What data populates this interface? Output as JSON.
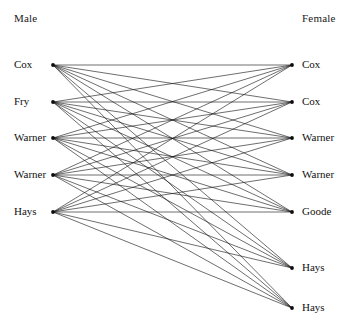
{
  "header": {
    "left_title": "Male",
    "right_title": "Female"
  },
  "chart_data": {
    "type": "diagram",
    "diagram_kind": "bipartite-graph",
    "title": "",
    "left_group_label": "Male",
    "right_group_label": "Female",
    "left_nodes": [
      {
        "id": "L0",
        "label": "Cox",
        "x": 53,
        "y": 65
      },
      {
        "id": "L1",
        "label": "Fry",
        "x": 53,
        "y": 102
      },
      {
        "id": "L2",
        "label": "Warner",
        "x": 53,
        "y": 138
      },
      {
        "id": "L3",
        "label": "Warner",
        "x": 53,
        "y": 175
      },
      {
        "id": "L4",
        "label": "Hays",
        "x": 53,
        "y": 212
      }
    ],
    "right_nodes": [
      {
        "id": "R0",
        "label": "Cox",
        "x": 292,
        "y": 65
      },
      {
        "id": "R1",
        "label": "Cox",
        "x": 292,
        "y": 102
      },
      {
        "id": "R2",
        "label": "Warner",
        "x": 292,
        "y": 138
      },
      {
        "id": "R3",
        "label": "Warner",
        "x": 292,
        "y": 175
      },
      {
        "id": "R4",
        "label": "Goode",
        "x": 292,
        "y": 212
      },
      {
        "id": "R5",
        "label": "Hays",
        "x": 292,
        "y": 268
      },
      {
        "id": "R6",
        "label": "Hays",
        "x": 292,
        "y": 308
      }
    ],
    "edges": [
      [
        "L0",
        "R0"
      ],
      [
        "L0",
        "R1"
      ],
      [
        "L0",
        "R2"
      ],
      [
        "L0",
        "R3"
      ],
      [
        "L0",
        "R4"
      ],
      [
        "L0",
        "R5"
      ],
      [
        "L0",
        "R6"
      ],
      [
        "L1",
        "R0"
      ],
      [
        "L1",
        "R1"
      ],
      [
        "L1",
        "R2"
      ],
      [
        "L1",
        "R3"
      ],
      [
        "L1",
        "R4"
      ],
      [
        "L1",
        "R5"
      ],
      [
        "L1",
        "R6"
      ],
      [
        "L2",
        "R0"
      ],
      [
        "L2",
        "R1"
      ],
      [
        "L2",
        "R2"
      ],
      [
        "L2",
        "R3"
      ],
      [
        "L2",
        "R4"
      ],
      [
        "L2",
        "R5"
      ],
      [
        "L2",
        "R6"
      ],
      [
        "L3",
        "R0"
      ],
      [
        "L3",
        "R1"
      ],
      [
        "L3",
        "R2"
      ],
      [
        "L3",
        "R3"
      ],
      [
        "L3",
        "R4"
      ],
      [
        "L3",
        "R5"
      ],
      [
        "L3",
        "R6"
      ],
      [
        "L4",
        "R0"
      ],
      [
        "L4",
        "R1"
      ],
      [
        "L4",
        "R2"
      ],
      [
        "L4",
        "R3"
      ],
      [
        "L4",
        "R4"
      ],
      [
        "L4",
        "R5"
      ],
      [
        "L4",
        "R6"
      ]
    ],
    "edge_count": 35,
    "left_node_count": 5,
    "right_node_count": 7,
    "edge_color": "#141414",
    "node_color": "#0d0d0d",
    "background_color": "#ffffff"
  }
}
